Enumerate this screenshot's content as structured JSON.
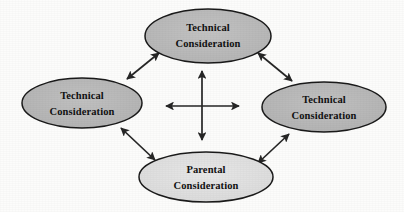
{
  "diagram": {
    "type": "relationship-diagram",
    "background_color": "#fcfcfb",
    "outline_color": "#1a1a1a",
    "arrow_color": "#262626",
    "nodes": [
      {
        "id": "top",
        "position": "top",
        "line1": "Technical",
        "line2": "Consideration",
        "fill_color": "#b9b9b9",
        "cx": 208,
        "cy": 36,
        "rx": 63,
        "ry": 27
      },
      {
        "id": "left",
        "position": "left",
        "line1": "Technical",
        "line2": "Consideration",
        "fill_color": "#b9b9b9",
        "cx": 82,
        "cy": 103,
        "rx": 60,
        "ry": 25
      },
      {
        "id": "right",
        "position": "right",
        "line1": "Technical",
        "line2": "Consideration",
        "fill_color": "#b9b9b9",
        "cx": 324,
        "cy": 107,
        "rx": 62,
        "ry": 25
      },
      {
        "id": "bottom",
        "position": "bottom",
        "line1": "Parental",
        "line2": "Consideration",
        "fill_color": "#e0e0e0",
        "cx": 206,
        "cy": 177,
        "rx": 67,
        "ry": 25
      }
    ],
    "connectors": [
      {
        "id": "top-left-diagonal",
        "kind": "double-headed-arrow",
        "from": "left",
        "to": "top"
      },
      {
        "id": "top-right-diagonal",
        "kind": "double-headed-arrow",
        "from": "top",
        "to": "right"
      },
      {
        "id": "bottom-left-diagonal",
        "kind": "double-headed-arrow",
        "from": "left",
        "to": "bottom"
      },
      {
        "id": "bottom-right-diagonal",
        "kind": "double-headed-arrow",
        "from": "bottom",
        "to": "right"
      },
      {
        "id": "center-vertical",
        "kind": "double-headed-arrow",
        "orientation": "vertical"
      },
      {
        "id": "center-horizontal",
        "kind": "double-headed-arrow",
        "orientation": "horizontal"
      }
    ]
  }
}
